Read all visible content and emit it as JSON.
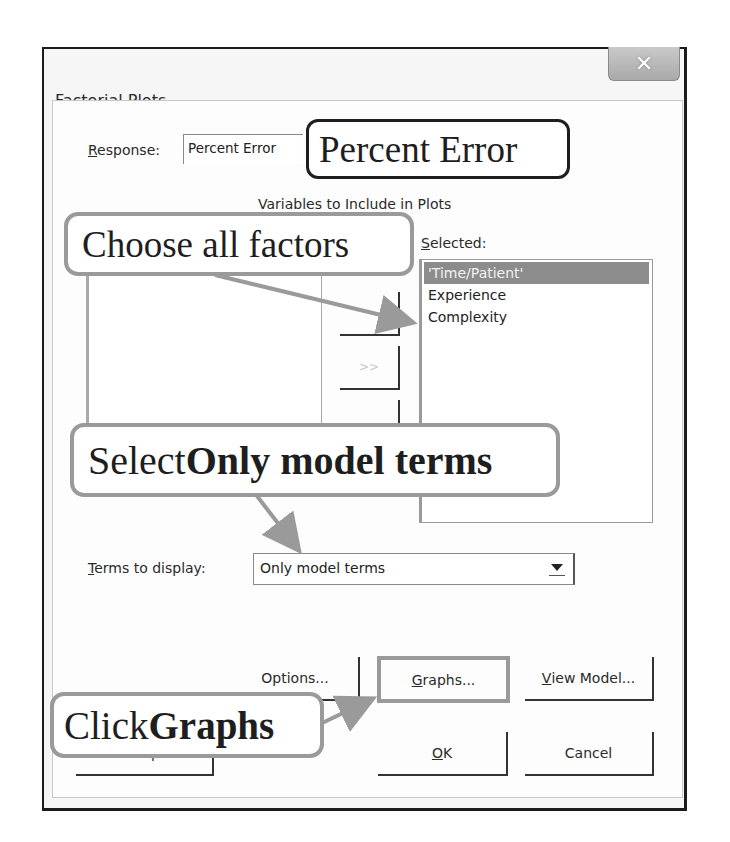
{
  "window": {
    "title": "Factorial Plots",
    "close_icon": "close-x-icon"
  },
  "response": {
    "label_prefix": "",
    "label_underlined": "R",
    "label_rest": "esponse:",
    "value": "Percent Error"
  },
  "variables": {
    "group_label": "Variables to Include in Plots",
    "selected_label_underlined": "S",
    "selected_label_rest": "elected:",
    "available_items": [],
    "selected_items": [
      {
        "label": "'Time/Patient'",
        "selected": true
      },
      {
        "label": "Experience",
        "selected": false
      },
      {
        "label": "Complexity",
        "selected": false
      }
    ],
    "move_buttons": [
      {
        "label": ">",
        "name": "add-one"
      },
      {
        "label": ">>",
        "name": "add-all"
      },
      {
        "label": "<",
        "name": "remove-one"
      }
    ]
  },
  "terms": {
    "label_underlined": "T",
    "label_rest": "erms to display:",
    "selected_value": "Only model terms",
    "dropdown_icon": "chevron-down-icon"
  },
  "buttons": {
    "options": {
      "underlined": "",
      "rest": "Options..."
    },
    "graphs": {
      "underlined": "G",
      "rest": "raphs..."
    },
    "view_model": {
      "underlined": "V",
      "rest": "iew Model..."
    },
    "help": {
      "label": "Help"
    },
    "ok": {
      "underlined": "O",
      "rest": "K"
    },
    "cancel": {
      "label": "Cancel"
    }
  },
  "annotations": {
    "response_callout": "Percent Error",
    "factors_callout": "Choose all factors",
    "terms_callout_plain": "Select ",
    "terms_callout_bold": "Only model terms",
    "graphs_callout_plain": "Click ",
    "graphs_callout_bold": "Graphs"
  },
  "colors": {
    "selection_bg": "#8c8c8c",
    "callout_border": "#9a9a9a",
    "window_border": "#1c1c1c"
  }
}
